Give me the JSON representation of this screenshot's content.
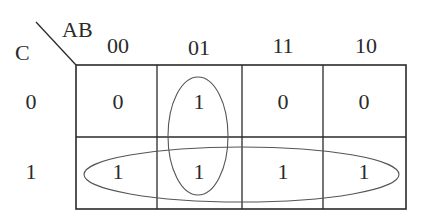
{
  "diagram": {
    "type": "karnaugh-map",
    "variables": {
      "column_vars": "AB",
      "row_vars": "C"
    },
    "column_headers": [
      "00",
      "01",
      "11",
      "10"
    ],
    "row_headers": [
      "0",
      "1"
    ],
    "cells": [
      [
        "0",
        "1",
        "0",
        "0"
      ],
      [
        "1",
        "1",
        "1",
        "1"
      ]
    ],
    "groups": [
      {
        "name": "vertical-group-col-01",
        "cells": [
          [
            0,
            1
          ],
          [
            1,
            1
          ]
        ]
      },
      {
        "name": "horizontal-group-row-1",
        "cells": [
          [
            1,
            0
          ],
          [
            1,
            1
          ],
          [
            1,
            2
          ],
          [
            1,
            3
          ]
        ]
      }
    ],
    "colors": {
      "line": "#2a2a2a",
      "group_outline": "#555555",
      "background": "#ffffff"
    }
  }
}
